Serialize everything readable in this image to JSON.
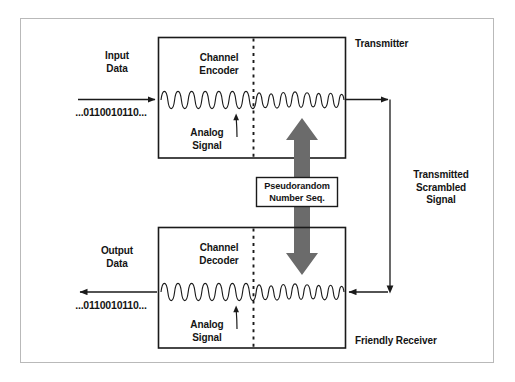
{
  "diagram": {
    "title_semantic": "Scrambling-Descrambling Block Diagram",
    "colors": {
      "stroke": "#1a1a1a",
      "arrow_gray": "#6b6b6b",
      "frame_gray": "#b9b9b9",
      "text": "#141414",
      "background": "#ffffff"
    },
    "labels": {
      "input_data": "Input\nData",
      "input_bits": "...0110010110...",
      "channel_encoder": "Channel\nEncoder",
      "analog_signal_top": "Analog\nSignal",
      "transmitter": "Transmitter",
      "pseudorandom": "Pseudorandom\nNumber Seq.",
      "transmitted_scrambled": "Transmitted\nScrambled\nSignal",
      "output_data": "Output\nData",
      "output_bits": "...0110010110...",
      "channel_decoder": "Channel\nDecoder",
      "analog_signal_bottom": "Analog\nSignal",
      "friendly_receiver": "Friendly Receiver"
    },
    "icons": {
      "up_arrow": "up-arrow-icon",
      "down_arrow": "down-arrow-icon",
      "input_arrow": "right-arrow-icon",
      "output_arrow": "left-arrow-icon",
      "waveform_top": "waveform-icon",
      "waveform_bottom": "waveform-icon",
      "divider_top": "dashed-divider-icon",
      "divider_bottom": "dashed-divider-icon",
      "callout_top": "curved-callout-arrow-icon",
      "callout_bottom": "curved-callout-arrow-icon"
    }
  }
}
